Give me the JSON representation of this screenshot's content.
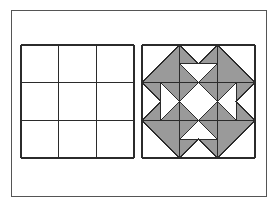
{
  "figure": {
    "canvas": {
      "width": 274,
      "height": 206,
      "background": "#ffffff"
    },
    "outer_frame": {
      "name": "outer-border-frame",
      "x": 11,
      "y": 10,
      "width": 255,
      "height": 186,
      "stroke": "#555555",
      "stroke_width": 1.2,
      "fill": "#ffffff"
    },
    "colors": {
      "shade_gray": "#9a9a9a",
      "white": "#ffffff",
      "line": "#2b2b2b",
      "frame_line": "#555555"
    },
    "panels": [
      {
        "id": "left-panel",
        "name": "plain-nine-patch-grid",
        "label": "Plain 3 by 3 grid square",
        "x": 21,
        "y": 45,
        "size": 113,
        "rows": 3,
        "columns": 3,
        "fill": "#ffffff",
        "stroke": "#2b2b2b",
        "stroke_width": 1.1,
        "cells": [
          {
            "row": 0,
            "col": 0,
            "pattern": "empty"
          },
          {
            "row": 0,
            "col": 1,
            "pattern": "empty"
          },
          {
            "row": 0,
            "col": 2,
            "pattern": "empty"
          },
          {
            "row": 1,
            "col": 0,
            "pattern": "empty"
          },
          {
            "row": 1,
            "col": 1,
            "pattern": "empty"
          },
          {
            "row": 1,
            "col": 2,
            "pattern": "empty"
          },
          {
            "row": 2,
            "col": 0,
            "pattern": "empty"
          },
          {
            "row": 2,
            "col": 1,
            "pattern": "empty"
          },
          {
            "row": 2,
            "col": 2,
            "pattern": "empty"
          }
        ]
      },
      {
        "id": "right-panel",
        "name": "shaded-quilt-block",
        "label": "Shaded quilt block square",
        "x": 142,
        "y": 45,
        "size": 113,
        "rows": 3,
        "columns": 3,
        "fill": "#ffffff",
        "stroke": "#2b2b2b",
        "stroke_width": 1.1,
        "cells": [
          {
            "row": 0,
            "col": 0,
            "pattern": "half-square-triangle",
            "shaded_corner": "bottom-right",
            "name": "cell-top-left"
          },
          {
            "row": 0,
            "col": 1,
            "pattern": "double-flying-geese",
            "point_direction": "down",
            "name": "cell-top-center"
          },
          {
            "row": 0,
            "col": 2,
            "pattern": "half-square-triangle",
            "shaded_corner": "bottom-left",
            "name": "cell-top-right"
          },
          {
            "row": 1,
            "col": 0,
            "pattern": "double-flying-geese",
            "point_direction": "right",
            "name": "cell-middle-left"
          },
          {
            "row": 1,
            "col": 1,
            "pattern": "square-in-square",
            "center_fill": "#ffffff",
            "name": "cell-center"
          },
          {
            "row": 1,
            "col": 2,
            "pattern": "double-flying-geese",
            "point_direction": "left",
            "name": "cell-middle-right"
          },
          {
            "row": 2,
            "col": 0,
            "pattern": "half-square-triangle",
            "shaded_corner": "top-right",
            "name": "cell-bottom-left"
          },
          {
            "row": 2,
            "col": 1,
            "pattern": "double-flying-geese",
            "point_direction": "up",
            "name": "cell-bottom-center"
          },
          {
            "row": 2,
            "col": 2,
            "pattern": "half-square-triangle",
            "shaded_corner": "top-left",
            "name": "cell-bottom-right"
          }
        ]
      }
    ]
  }
}
